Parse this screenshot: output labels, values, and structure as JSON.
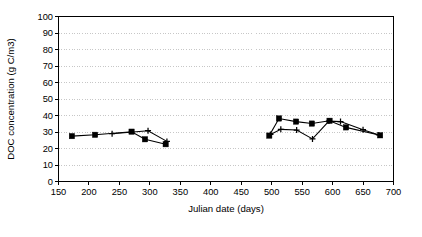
{
  "chart_data": {
    "type": "line",
    "title": "",
    "xlabel": "Julian date (days)",
    "ylabel": "DOC concentration (g C/m3)",
    "xlim": [
      150,
      700
    ],
    "ylim": [
      0,
      100
    ],
    "xticks": [
      150,
      200,
      250,
      300,
      350,
      400,
      450,
      500,
      550,
      600,
      650,
      700
    ],
    "yticks": [
      0,
      10,
      20,
      30,
      40,
      50,
      60,
      70,
      80,
      90,
      100
    ],
    "grid": "horizontal-dotted",
    "legend": "none",
    "marker_colors": {
      "series1": "#000000",
      "series2": "#000000"
    },
    "series": [
      {
        "name": "Series 1 (filled square)",
        "marker": "square",
        "points": [
          {
            "x": 172,
            "y": 27.5
          },
          {
            "x": 210,
            "y": 28.3
          },
          {
            "x": 270,
            "y": 30.2
          },
          {
            "x": 292,
            "y": 25.6
          },
          {
            "x": 326,
            "y": 22.6
          }
        ]
      },
      {
        "name": "Series 2 (plus marker)",
        "marker": "plus",
        "points": [
          {
            "x": 238,
            "y": 29.0
          },
          {
            "x": 297,
            "y": 30.8
          },
          {
            "x": 328,
            "y": 24.3
          }
        ]
      },
      {
        "name": "Series 3 (filled square, second period)",
        "marker": "square",
        "points": [
          {
            "x": 496,
            "y": 27.8
          },
          {
            "x": 512,
            "y": 38.2
          },
          {
            "x": 540,
            "y": 36.3
          },
          {
            "x": 566,
            "y": 35.1
          },
          {
            "x": 595,
            "y": 36.8
          },
          {
            "x": 622,
            "y": 32.8
          },
          {
            "x": 678,
            "y": 28.0
          }
        ]
      },
      {
        "name": "Series 4 (plus marker, second period)",
        "marker": "plus",
        "points": [
          {
            "x": 498,
            "y": 28.5
          },
          {
            "x": 515,
            "y": 31.6
          },
          {
            "x": 541,
            "y": 31.2
          },
          {
            "x": 567,
            "y": 25.8
          },
          {
            "x": 594,
            "y": 36.6
          },
          {
            "x": 613,
            "y": 36.3
          },
          {
            "x": 650,
            "y": 31.4
          },
          {
            "x": 676,
            "y": 28.2
          }
        ]
      }
    ]
  }
}
